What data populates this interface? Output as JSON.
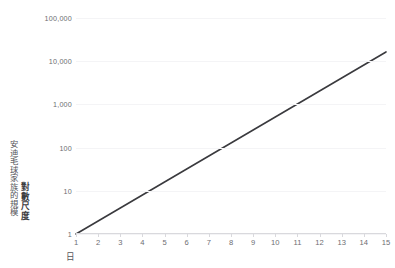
{
  "top_strip_text": "",
  "chart_data": {
    "type": "line",
    "title": "",
    "xlabel": "日",
    "ylabel": "安迪毛球家族的規模",
    "ylabel_emphasis": "對數尺度",
    "yscale": "log",
    "ylim": [
      1,
      100000
    ],
    "xlim": [
      1,
      15
    ],
    "grid": true,
    "legend": false,
    "line_color": "#3a3a3e",
    "grid_color": "#f4f4f6",
    "axis_color": "#d9d9dd",
    "y_ticks": [
      1,
      10,
      100,
      1000,
      10000,
      100000
    ],
    "y_tick_labels": [
      "1",
      "10",
      "100",
      "1,000",
      "10,000",
      "100,000"
    ],
    "x_ticks": [
      1,
      2,
      3,
      4,
      5,
      6,
      7,
      8,
      9,
      10,
      11,
      12,
      13,
      14,
      15
    ],
    "x_tick_labels": [
      "1",
      "2",
      "3",
      "4",
      "5",
      "6",
      "7",
      "8",
      "9",
      "10",
      "11",
      "12",
      "13",
      "14",
      "15"
    ],
    "series": [
      {
        "name": "安迪毛球家族的規模",
        "x": [
          1,
          2,
          3,
          4,
          5,
          6,
          7,
          8,
          9,
          10,
          11,
          12,
          13,
          14,
          15
        ],
        "values": [
          1,
          2,
          4,
          8,
          16,
          32,
          64,
          128,
          256,
          512,
          1024,
          2048,
          4096,
          8192,
          16384
        ]
      }
    ]
  }
}
